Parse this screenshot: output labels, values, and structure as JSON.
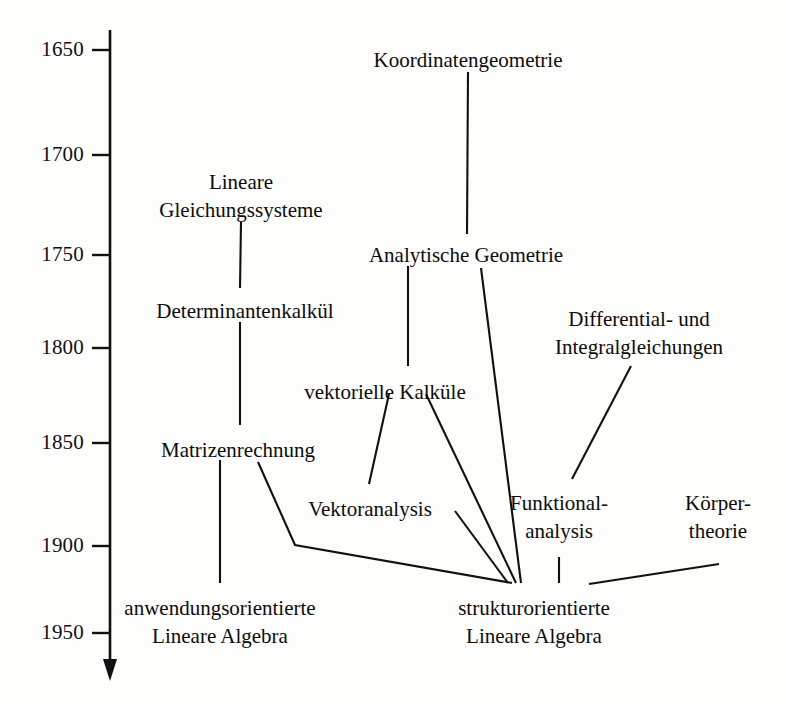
{
  "figure": {
    "kind": "timeline-genealogy-diagram",
    "language": "de",
    "background_color": "#fdfdfb",
    "ink_color": "#111111",
    "width": 786,
    "height": 704
  },
  "axis": {
    "name": "year-axis",
    "orientation": "vertical",
    "direction": "downward",
    "x": 110,
    "y_start": 30,
    "y_end": 681,
    "arrow": "down-arrow",
    "ticks": [
      {
        "label": "1650",
        "y": 50
      },
      {
        "label": "1700",
        "y": 155
      },
      {
        "label": "1750",
        "y": 255
      },
      {
        "label": "1800",
        "y": 348
      },
      {
        "label": "1850",
        "y": 443
      },
      {
        "label": "1900",
        "y": 546
      },
      {
        "label": "1950",
        "y": 633
      }
    ]
  },
  "nodes": [
    {
      "id": "koordinatengeometrie",
      "lines": [
        "Koordinatengeometrie"
      ],
      "x": 468,
      "y": 48,
      "year": 1650
    },
    {
      "id": "lineare-gleichungssysteme",
      "lines": [
        "Lineare",
        "Gleichungssysteme"
      ],
      "x": 241,
      "y": 168,
      "year": 1710
    },
    {
      "id": "analytische-geometrie",
      "lines": [
        "Analytische Geometrie"
      ],
      "x": 466,
      "y": 243,
      "year": 1750
    },
    {
      "id": "determinantenkalkuel",
      "lines": [
        "Determinantenkalkül"
      ],
      "x": 245,
      "y": 299,
      "year": 1790
    },
    {
      "id": "differential-und-integralgleichungen",
      "lines": [
        "Differential- und",
        "Integralgleichungen"
      ],
      "x": 639,
      "y": 305,
      "year": 1795
    },
    {
      "id": "vektorielle-kalkuele",
      "lines": [
        "vektorielle Kalküle"
      ],
      "x": 385,
      "y": 380,
      "year": 1820
    },
    {
      "id": "matrizenrechnung",
      "lines": [
        "Matrizenrechnung"
      ],
      "x": 238,
      "y": 438,
      "year": 1850
    },
    {
      "id": "vektoranalysis",
      "lines": [
        "Vektoranalysis"
      ],
      "x": 370,
      "y": 497,
      "year": 1875
    },
    {
      "id": "funktionalanalysis",
      "lines": [
        "Funktional-",
        "analysis"
      ],
      "x": 559,
      "y": 489,
      "year": 1880
    },
    {
      "id": "koerpertheorie",
      "lines": [
        "Körper-",
        "theorie"
      ],
      "x": 718,
      "y": 489,
      "year": 1885
    },
    {
      "id": "anwendungsorientierte-lineare-algebra",
      "lines": [
        "anwendungsorientierte",
        "Lineare Algebra"
      ],
      "x": 220,
      "y": 594,
      "year": 1930
    },
    {
      "id": "strukturorientierte-lineare-algebra",
      "lines": [
        "strukturorientierte",
        "Lineare Algebra"
      ],
      "x": 534,
      "y": 594,
      "year": 1930
    }
  ],
  "edges": [
    {
      "id": "edge-koordinatengeometrie-analytische",
      "from": "koordinatengeometrie",
      "to": "analytische-geometrie",
      "points": "468,72 467,234"
    },
    {
      "id": "edge-gleichungssysteme-determinanten",
      "from": "lineare-gleichungssysteme",
      "to": "determinantenkalkuel",
      "points": "241,222 240,288"
    },
    {
      "id": "edge-determinanten-matrizen",
      "from": "determinantenkalkuel",
      "to": "matrizenrechnung",
      "points": "240,322 240,425"
    },
    {
      "id": "edge-analytische-vektorielle",
      "from": "analytische-geometrie",
      "to": "vektorielle-kalkuele",
      "points": "408,266 408,366"
    },
    {
      "id": "edge-analytische-struktur",
      "from": "analytische-geometrie",
      "to": "strukturorientierte-lineare-algebra",
      "points": "481,268 521,583"
    },
    {
      "id": "edge-vektorielle-vektoranalysis",
      "from": "vektorielle-kalkuele",
      "to": "vektoranalysis",
      "points": "389,394 369,484"
    },
    {
      "id": "edge-vektorielle-struktur",
      "from": "vektorielle-kalkuele",
      "to": "strukturorientierte-lineare-algebra",
      "points": "426,394 516,583"
    },
    {
      "id": "edge-matrizen-anwendung",
      "from": "matrizenrechnung",
      "to": "anwendungsorientierte-lineare-algebra",
      "points": "220,460 220,583"
    },
    {
      "id": "edge-matrizen-struktur",
      "from": "matrizenrechnung",
      "to": "strukturorientierte-lineare-algebra",
      "points": "258,462 295,545 512,583"
    },
    {
      "id": "edge-vektoranalysis-struktur",
      "from": "vektoranalysis",
      "to": "strukturorientierte-lineare-algebra",
      "points": "455,511 508,583"
    },
    {
      "id": "edge-differential-funktional",
      "from": "differential-und-integralgleichungen",
      "to": "funktionalanalysis",
      "points": "631,366 572,479"
    },
    {
      "id": "edge-funktional-struktur",
      "from": "funktionalanalysis",
      "to": "strukturorientierte-lineare-algebra",
      "points": "559,557 559,583"
    },
    {
      "id": "edge-koerpertheorie-struktur",
      "from": "koerpertheorie",
      "to": "strukturorientierte-lineare-algebra",
      "points": "719,564 589,584"
    }
  ],
  "caption": {
    "text": ""
  }
}
